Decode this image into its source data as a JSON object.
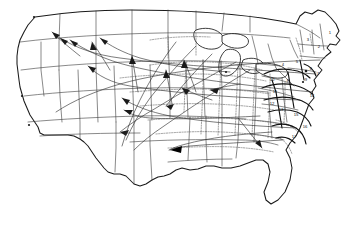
{
  "map": {
    "title": "United States flow / migration map",
    "projection_note": "Conterminous United States, curved parallels",
    "background_color": "#ffffff",
    "outline_color": "#1a1a1a",
    "state_border_color": "#3a3a3a",
    "subregion_border_color": "#555555",
    "flow_color": "#2a2a2a",
    "legend_visible": false,
    "title_visible": false,
    "regions": [
      {
        "id": "1",
        "label": "1",
        "x": 330,
        "y": 33
      },
      {
        "id": "2",
        "label": "2",
        "x": 319,
        "y": 47
      },
      {
        "id": "3",
        "label": "3",
        "x": 308,
        "y": 40
      },
      {
        "id": "4",
        "label": "4",
        "x": 283,
        "y": 65
      },
      {
        "id": "5",
        "label": "5",
        "x": 297,
        "y": 62
      },
      {
        "id": "6",
        "label": "6",
        "x": 311,
        "y": 69
      },
      {
        "id": "7",
        "label": "7",
        "x": 318,
        "y": 74
      },
      {
        "id": "8",
        "label": "8",
        "x": 288,
        "y": 81
      },
      {
        "id": "9",
        "label": "9",
        "x": 306,
        "y": 80
      },
      {
        "id": "10",
        "label": "10",
        "x": 272,
        "y": 80
      },
      {
        "id": "11",
        "label": "11",
        "x": 275,
        "y": 92
      },
      {
        "id": "12",
        "label": "12",
        "x": 272,
        "y": 104
      },
      {
        "id": "13",
        "label": "13",
        "x": 281,
        "y": 110
      },
      {
        "id": "14",
        "label": "14",
        "x": 312,
        "y": 96
      },
      {
        "id": "15",
        "label": "15",
        "x": 296,
        "y": 115
      },
      {
        "id": "16",
        "label": "16",
        "x": 305,
        "y": 127
      },
      {
        "id": "17",
        "label": "17",
        "x": 294,
        "y": 137
      }
    ],
    "flow_arrows": [
      {
        "from": "northeast-corridor",
        "to": "pacific-northwest",
        "style": "long-curve"
      },
      {
        "from": "great-lakes",
        "to": "northern-rockies",
        "style": "long-curve"
      },
      {
        "from": "mid-atlantic",
        "to": "great-basin",
        "style": "long-curve"
      },
      {
        "from": "southeast",
        "to": "southern-plains",
        "style": "long-curve"
      },
      {
        "from": "gulf-coast",
        "to": "southwest",
        "style": "long-curve"
      },
      {
        "from": "midwest",
        "to": "upper-midwest",
        "style": "short-curve"
      },
      {
        "from": "atlantic-coast",
        "to": "central-plains",
        "style": "long-curve"
      },
      {
        "from": "new-england",
        "to": "california",
        "style": "long-curve"
      }
    ]
  }
}
